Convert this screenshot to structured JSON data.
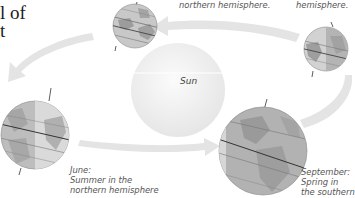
{
  "title": {
    "line1": "l of",
    "line2": "t"
  },
  "sun": {
    "label": "Sun",
    "color": "#f0f0f0"
  },
  "captions": {
    "top_center": {
      "line1": "northern hemisphere."
    },
    "top_right": {
      "line1": "hemisphere."
    },
    "june": {
      "line1": "June:",
      "line2": "Summer in the",
      "line3": "northern hemisphere"
    },
    "september": {
      "line1": "September:",
      "line2": "Spring in",
      "line3": "the southern"
    }
  },
  "globes": [
    {
      "name": "globe-top-left",
      "position": "upper-left"
    },
    {
      "name": "globe-top-right",
      "position": "upper-right"
    },
    {
      "name": "globe-june",
      "position": "left"
    },
    {
      "name": "globe-september",
      "position": "lower-right"
    }
  ],
  "colors": {
    "orbit_arrow": "#e3e3e3",
    "globe_land": "#9a9a9a",
    "globe_ocean": "#bdbdbd",
    "globe_light": "#d8d8d8",
    "text": "#555555"
  }
}
